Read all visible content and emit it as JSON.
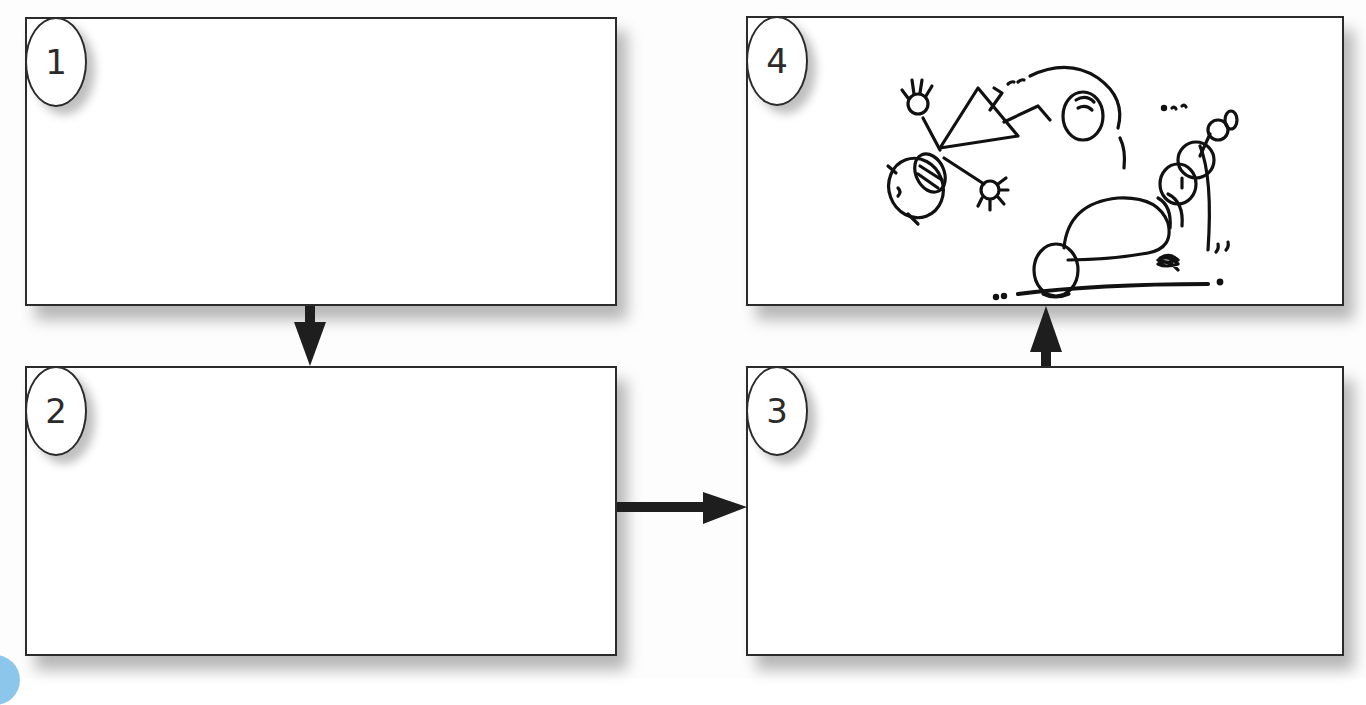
{
  "diagram": {
    "type": "storyboard-flow",
    "layout": "2x2 grid of panels",
    "panels": [
      {
        "id": 1,
        "number_label": "1",
        "content": "empty",
        "position": "top-left"
      },
      {
        "id": 2,
        "number_label": "2",
        "content": "empty",
        "position": "bottom-left"
      },
      {
        "id": 3,
        "number_label": "3",
        "content": "empty",
        "position": "bottom-right"
      },
      {
        "id": 4,
        "number_label": "4",
        "content": "cartoon drawing: stick figure flung in the air after tripping over a crouching figure",
        "position": "top-right"
      }
    ],
    "arrows": [
      {
        "from": 1,
        "to": 2,
        "direction": "down"
      },
      {
        "from": 2,
        "to": 3,
        "direction": "right"
      },
      {
        "from": 3,
        "to": 4,
        "direction": "up"
      }
    ],
    "colors": {
      "line": "#2b2b2b",
      "panel_fill": "#ffffff",
      "page_background": "#fdfdfd",
      "corner_accent": "#8cc6ea"
    }
  }
}
